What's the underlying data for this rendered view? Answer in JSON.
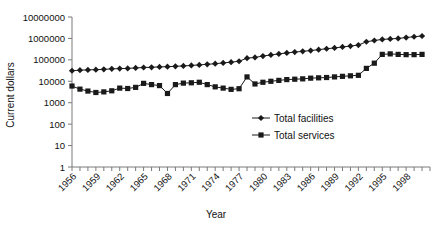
{
  "chart_data": {
    "type": "line",
    "title": "",
    "xlabel": "Year",
    "ylabel": "Current dollars",
    "xlim": [
      1956,
      2001
    ],
    "ylim": [
      1,
      10000000
    ],
    "yscale": "log",
    "grid": false,
    "legend_position": "center-right",
    "ytick_labels": [
      "10000000",
      "1000000",
      "100000",
      "10000",
      "1000",
      "100",
      "10",
      "1"
    ],
    "ytick_values": [
      10000000,
      1000000,
      100000,
      10000,
      1000,
      100,
      10,
      1
    ],
    "xtick_labels": [
      "1956",
      "1959",
      "1962",
      "1965",
      "1968",
      "1971",
      "1974",
      "1977",
      "1980",
      "1983",
      "1986",
      "1989",
      "1992",
      "1995",
      "1998"
    ],
    "xtick_values": [
      1956,
      1959,
      1962,
      1965,
      1968,
      1971,
      1974,
      1977,
      1980,
      1983,
      1986,
      1989,
      1992,
      1995,
      1998
    ],
    "x": [
      1956,
      1957,
      1958,
      1959,
      1960,
      1961,
      1962,
      1963,
      1964,
      1965,
      1966,
      1967,
      1968,
      1969,
      1970,
      1971,
      1972,
      1973,
      1974,
      1975,
      1976,
      1977,
      1978,
      1979,
      1980,
      1981,
      1982,
      1983,
      1984,
      1985,
      1986,
      1987,
      1988,
      1989,
      1990,
      1991,
      1992,
      1993,
      1994,
      1995,
      1996,
      1997,
      1998,
      1999,
      2000
    ],
    "series": [
      {
        "name": "Total facilities",
        "marker": "diamond",
        "color": "#1a1a1a",
        "values": [
          31000,
          33000,
          34000,
          35000,
          36000,
          38000,
          39000,
          40000,
          42000,
          44000,
          45000,
          47000,
          48000,
          50000,
          52000,
          55000,
          58000,
          62000,
          66000,
          72000,
          78000,
          86000,
          120000,
          130000,
          150000,
          170000,
          190000,
          210000,
          230000,
          250000,
          270000,
          300000,
          330000,
          360000,
          400000,
          440000,
          490000,
          700000,
          800000,
          900000,
          950000,
          1000000,
          1100000,
          1200000,
          1300000
        ]
      },
      {
        "name": "Total services",
        "marker": "square",
        "color": "#1a1a1a",
        "values": [
          6000,
          4300,
          3500,
          3000,
          3200,
          3600,
          4800,
          4600,
          5200,
          8000,
          7000,
          6300,
          2700,
          7000,
          8200,
          8500,
          9000,
          7000,
          5500,
          4800,
          4200,
          4500,
          16000,
          7500,
          9000,
          10000,
          11000,
          12000,
          12500,
          13000,
          14000,
          14500,
          15000,
          16000,
          17000,
          18000,
          19000,
          40000,
          70000,
          180000,
          190000,
          180000,
          175000,
          175000,
          180000
        ]
      }
    ]
  },
  "legend": {
    "items": [
      {
        "label": "Total facilities",
        "marker": "diamond"
      },
      {
        "label": "Total services",
        "marker": "square"
      }
    ]
  }
}
